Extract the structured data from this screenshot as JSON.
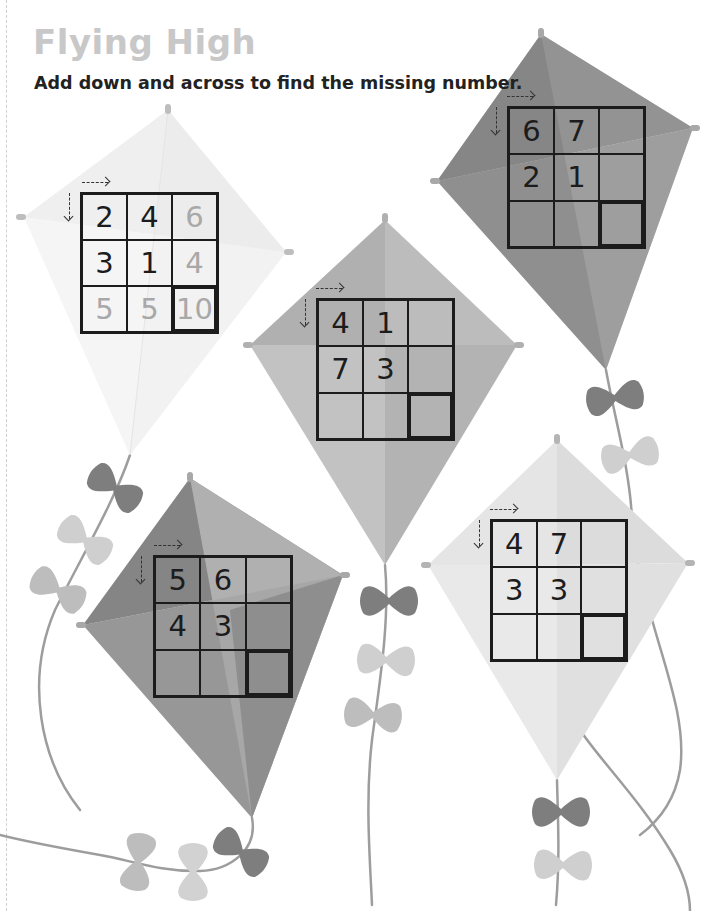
{
  "title": "Flying High",
  "instruction": "Add down and across to find the missing number.",
  "colors": {
    "title": "#c8c8c8",
    "text": "#222222",
    "grid_line": "#1c1c1c",
    "answer_digits": "#a8a8a8"
  },
  "kites": [
    {
      "id": "kite-example",
      "shade": "very-light",
      "solved": true,
      "grid": [
        [
          "2",
          "4",
          "6"
        ],
        [
          "3",
          "1",
          "4"
        ],
        [
          "5",
          "5",
          "10"
        ]
      ]
    },
    {
      "id": "kite-top-right",
      "shade": "dark",
      "solved": false,
      "grid": [
        [
          "6",
          "7",
          ""
        ],
        [
          "2",
          "1",
          ""
        ],
        [
          "",
          "",
          ""
        ]
      ]
    },
    {
      "id": "kite-center",
      "shade": "medium",
      "solved": false,
      "grid": [
        [
          "4",
          "1",
          ""
        ],
        [
          "7",
          "3",
          ""
        ],
        [
          "",
          "",
          ""
        ]
      ]
    },
    {
      "id": "kite-bottom-left",
      "shade": "dark",
      "solved": false,
      "grid": [
        [
          "5",
          "6",
          ""
        ],
        [
          "4",
          "3",
          ""
        ],
        [
          "",
          "",
          ""
        ]
      ]
    },
    {
      "id": "kite-bottom-right",
      "shade": "light",
      "solved": false,
      "grid": [
        [
          "4",
          "7",
          ""
        ],
        [
          "3",
          "3",
          ""
        ],
        [
          "",
          "",
          ""
        ]
      ]
    }
  ],
  "direction_hints": {
    "across": "dashed-arrow-right",
    "down": "dashed-arrow-down"
  }
}
